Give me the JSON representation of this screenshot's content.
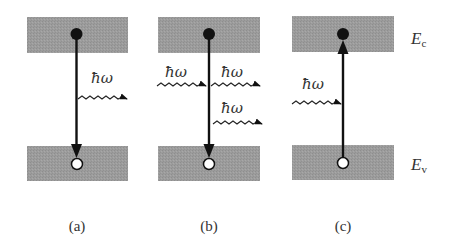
{
  "diagram": {
    "type": "band-transition-diagram",
    "colors": {
      "band_fill": "#9a9a9a",
      "line": "#111111",
      "electron": "#111111",
      "hole_fill": "#ffffff",
      "background": "#ffffff"
    },
    "energy_labels": {
      "conduction": {
        "main": "E",
        "sub": "c"
      },
      "valence": {
        "main": "E",
        "sub": "v"
      }
    },
    "panels": [
      {
        "id": "a",
        "caption": "(a)",
        "process": "spontaneous emission",
        "transition_direction": "down",
        "photons": [
          {
            "label": "ħω",
            "direction": "outgoing"
          }
        ]
      },
      {
        "id": "b",
        "caption": "(b)",
        "process": "stimulated emission",
        "transition_direction": "down",
        "photons": [
          {
            "label": "ħω",
            "direction": "incoming"
          },
          {
            "label": "ħω",
            "direction": "outgoing"
          },
          {
            "label": "ħω",
            "direction": "outgoing"
          }
        ]
      },
      {
        "id": "c",
        "caption": "(c)",
        "process": "absorption",
        "transition_direction": "up",
        "photons": [
          {
            "label": "ħω",
            "direction": "incoming"
          }
        ]
      }
    ]
  }
}
